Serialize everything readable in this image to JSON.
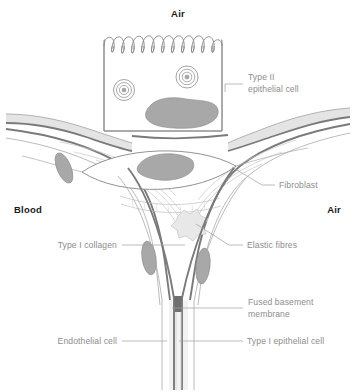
{
  "figure": {
    "background_color": "#ffffff"
  },
  "regions": [
    {
      "id": "air-top",
      "label": "Air",
      "x": 178,
      "y": 17,
      "anchor": "middle"
    },
    {
      "id": "blood-left",
      "label": "Blood",
      "x": 14,
      "y": 213,
      "anchor": "start"
    },
    {
      "id": "air-right",
      "label": "Air",
      "x": 341,
      "y": 213,
      "anchor": "end"
    }
  ],
  "callouts": [
    {
      "id": "type-ii-epithelial-cell",
      "lines": [
        "Type II",
        "epithelial cell"
      ],
      "text_x": 248,
      "text_y": 80,
      "anchor": "start",
      "leader": "M 243 84 L 225 84 M 225 84 L 225 92"
    },
    {
      "id": "fibroblast",
      "lines": [
        "Fibroblast"
      ],
      "text_x": 279,
      "text_y": 188,
      "anchor": "start",
      "leader": "M 275 185 L 262 185 L 232 167"
    },
    {
      "id": "type-i-collagen",
      "lines": [
        "Type I collagen"
      ],
      "text_x": 117,
      "text_y": 248,
      "anchor": "end",
      "leader": "M 122 245 L 185 245"
    },
    {
      "id": "elastic-fibres",
      "lines": [
        "Elastic fibres"
      ],
      "text_x": 247,
      "text_y": 248,
      "anchor": "start",
      "leader": "M 243 245 L 229 245 L 196 224"
    },
    {
      "id": "fused-basement-membrane",
      "lines": [
        "Fused basement",
        "membrane"
      ],
      "text_x": 248,
      "text_y": 305,
      "anchor": "start",
      "leader": "M 243 308 L 172 308"
    },
    {
      "id": "endothelial-cell",
      "lines": [
        "Endothelial cell"
      ],
      "text_x": 117,
      "text_y": 344,
      "anchor": "end",
      "leader": "M 122 341 L 167 341"
    },
    {
      "id": "type-i-epithelial-cell",
      "lines": [
        "Type I epithelial cell"
      ],
      "text_x": 247,
      "text_y": 344,
      "anchor": "start",
      "leader": "M 243 341 L 179 341"
    }
  ],
  "colors": {
    "outline": "#6f6f6f",
    "outline_light": "#a9a9a9",
    "outline_faint": "#bdbdbd",
    "membrane_dark": "#7a7a7a",
    "nucleus_fill": "#a8a8a8",
    "nucleus_stroke": "#8f8f8f",
    "cytoplasm_fill": "#e4e4e4",
    "elastic_fill": "#e8e8e8",
    "lumen_fill": "#f2f2f2",
    "white": "#ffffff",
    "label_text": "#8d8d8d",
    "region_text": "#1a1a1a"
  },
  "structures": {
    "type_ii_cell": {
      "name": "Type II epithelial cell",
      "microvilli_count": 10,
      "lamellar_bodies": 2,
      "nucleus": 1
    },
    "fibroblast": {
      "name": "Fibroblast",
      "nucleus": 1
    },
    "elastic_fibres": {
      "name": "Elastic fibres",
      "shape": "star"
    },
    "endothelial_nuclei": 3,
    "capillary": {
      "name": "Capillary lumen"
    }
  }
}
